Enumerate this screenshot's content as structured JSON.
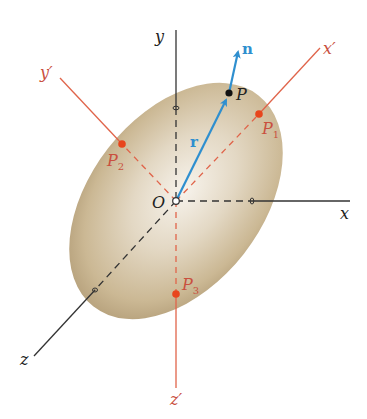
{
  "diagram": {
    "type": "principal-axes-of-inertia",
    "origin": {
      "label": "O"
    },
    "axes": {
      "x": {
        "label": "x"
      },
      "y": {
        "label": "y"
      },
      "z": {
        "label": "z"
      },
      "x_prime": {
        "label": "x′"
      },
      "y_prime": {
        "label": "y′"
      },
      "z_prime": {
        "label": "z′"
      }
    },
    "points": {
      "P": {
        "label": "P"
      },
      "P1": {
        "label": "P",
        "sub": "1"
      },
      "P2": {
        "label": "P",
        "sub": "2"
      },
      "P3": {
        "label": "P",
        "sub": "3"
      }
    },
    "vectors": {
      "r": {
        "label": "r"
      },
      "n": {
        "label": "n"
      }
    },
    "colors": {
      "ellipsoid_light": "#f4efe6",
      "ellipsoid_mid": "#d3c4a8",
      "ellipsoid_edge": "#b6a17d",
      "axis_black": "#333333",
      "axis_red": "#e0644a",
      "point_red": "#e8451c",
      "vector_blue": "#2f8fcf",
      "point_black": "#111111",
      "label_red": "#c9503f"
    }
  }
}
